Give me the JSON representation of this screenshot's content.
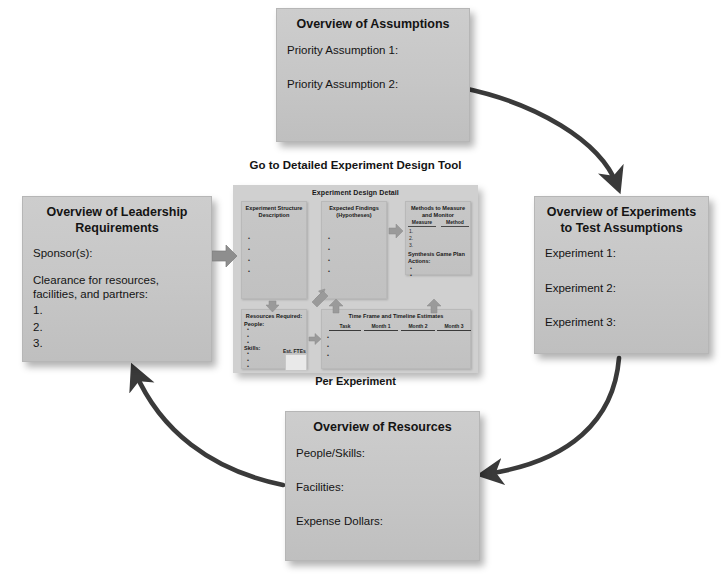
{
  "diagram": {
    "accent_box_color": "#c6c6c6",
    "arrow_color": "#3a3a3a",
    "block_arrow_color": "#8a8a8a"
  },
  "boxes": {
    "assumptions": {
      "title": "Overview of Assumptions",
      "rows": [
        "Priority Assumption 1:",
        "Priority Assumption 2:"
      ]
    },
    "experiments": {
      "title": "Overview of Experiments to Test Assumptions",
      "rows": [
        "Experiment 1:",
        "Experiment 2:",
        "Experiment 3:"
      ]
    },
    "resources": {
      "title": "Overview of Resources",
      "rows": [
        "People/Skills:",
        "Facilities:",
        "Expense Dollars:"
      ]
    },
    "leadership": {
      "title": "Overview of Leadership Requirements",
      "rows": [
        "Sponsor(s):",
        "Clearance for resources, facilities, and partners:",
        "1.",
        "2.",
        "3."
      ]
    }
  },
  "tool": {
    "caption": "Go to Detailed Experiment Design Tool",
    "footer": "Per Experiment",
    "panel_title": "Experiment Design Detail",
    "panels": {
      "structure": {
        "title": "Experiment Structure Description"
      },
      "findings": {
        "title": "Expected Findings (Hypotheses)"
      },
      "methods": {
        "title": "Methods to Measure and Monitor",
        "columns": [
          "Measure",
          "Method"
        ],
        "numbers": [
          "1.",
          "2.",
          "3."
        ],
        "synthesis_label": "Synthesis Game Plan Actions:"
      },
      "resources": {
        "title": "Resources Required:",
        "people_label": "People:",
        "skills_label": "Skills:",
        "fte_label": "Est. FTEs"
      },
      "timeline": {
        "title": "Time Frame and Timeline Estimates",
        "columns": [
          "Task",
          "Month 1",
          "Month 2",
          "Month 3"
        ]
      }
    }
  },
  "icons": {
    "feed_arrow": "arrow-right-block",
    "cycle_arrow": "curved-arrow"
  }
}
